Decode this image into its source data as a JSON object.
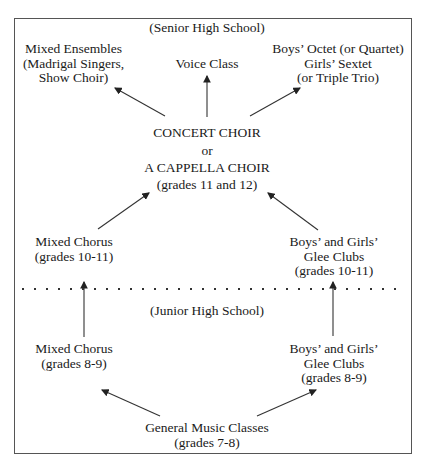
{
  "diagram": {
    "type": "flowchart",
    "sections": {
      "senior": "(Senior High School)",
      "junior": "(Junior High School)"
    },
    "nodes": {
      "mixed_ensembles": "Mixed Ensembles\n(Madrigal Singers,\nShow Choir)",
      "voice_class": "Voice Class",
      "small_groups": "Boys’ Octet (or Quartet)\nGirls’ Sextet\n(or Triple Trio)",
      "concert_choir_1": "CONCERT CHOIR",
      "concert_choir_or": "or",
      "concert_choir_2": "A CAPPELLA CHOIR",
      "concert_choir_grades": "(grades 11 and 12)",
      "mixed_chorus_sr": "Mixed Chorus\n(grades 10-11)",
      "glee_sr": "Boys’ and Girls’\nGlee Clubs\n(grades 10-11)",
      "mixed_chorus_jr": "Mixed Chorus\n(grades 8-9)",
      "glee_jr": "Boys’ and Girls’\nGlee Clubs\n(grades 8-9)",
      "general_music": "General Music Classes\n(grades 7-8)"
    },
    "edges": [
      [
        "concert_choir",
        "mixed_ensembles"
      ],
      [
        "concert_choir",
        "voice_class"
      ],
      [
        "concert_choir",
        "small_groups"
      ],
      [
        "mixed_chorus_sr",
        "concert_choir"
      ],
      [
        "glee_sr",
        "concert_choir"
      ],
      [
        "mixed_chorus_jr",
        "mixed_chorus_sr"
      ],
      [
        "glee_jr",
        "glee_sr"
      ],
      [
        "general_music",
        "mixed_chorus_jr"
      ],
      [
        "general_music",
        "glee_jr"
      ]
    ]
  }
}
